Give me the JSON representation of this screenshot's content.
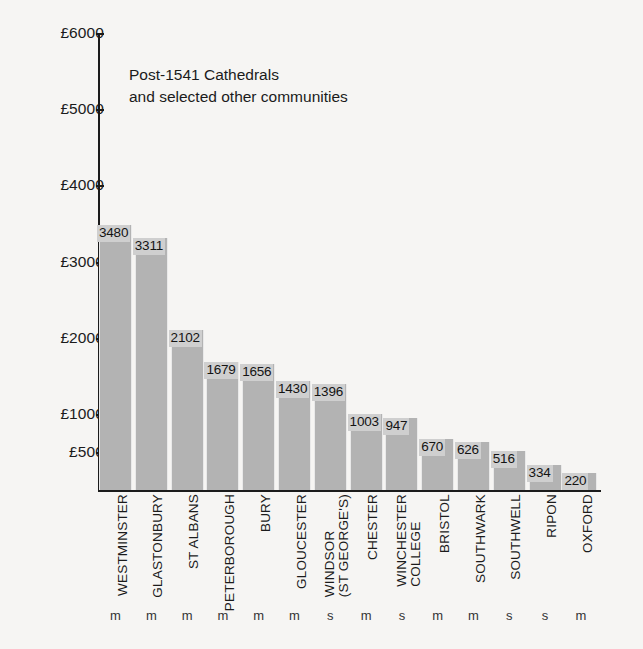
{
  "chart_data": {
    "type": "bar",
    "title": "Post-1541 Cathedrals and selected other communities",
    "title_lines": [
      "Post-1541 Cathedrals",
      "and selected other communities"
    ],
    "xlabel": "",
    "ylabel": "",
    "ylim": [
      0,
      6000
    ],
    "grid": false,
    "legend": null,
    "currency_symbol": "£",
    "y_ticks": [
      {
        "value": 6000,
        "label": "£6000"
      },
      {
        "value": 5000,
        "label": "£5000"
      },
      {
        "value": 4000,
        "label": "£4000"
      },
      {
        "value": 3000,
        "label": "£3000"
      },
      {
        "value": 2000,
        "label": "£2000"
      },
      {
        "value": 1000,
        "label": "£1000"
      },
      {
        "value": 500,
        "label": "£500"
      }
    ],
    "categories": [
      "WESTMINSTER",
      "GLASTONBURY",
      "ST ALBANS",
      "PETERBOROUGH",
      "BURY",
      "GLOUCESTER",
      "WINDSOR (ST GEORGE'S)",
      "CHESTER",
      "WINCHESTER COLLEGE",
      "BRISTOL",
      "SOUTHWARK",
      "SOUTHWELL",
      "RIPON",
      "OXFORD"
    ],
    "category_label_lines": [
      [
        "WESTMINSTER"
      ],
      [
        "GLASTONBURY"
      ],
      [
        "ST ALBANS"
      ],
      [
        "PETERBOROUGH"
      ],
      [
        "BURY"
      ],
      [
        "GLOUCESTER"
      ],
      [
        "WINDSOR",
        "(ST GEORGE'S)"
      ],
      [
        "CHESTER"
      ],
      [
        "WINCHESTER",
        "COLLEGE"
      ],
      [
        "BRISTOL"
      ],
      [
        "SOUTHWARK"
      ],
      [
        "SOUTHWELL"
      ],
      [
        "RIPON"
      ],
      [
        "OXFORD"
      ]
    ],
    "values": [
      3480,
      3311,
      2102,
      1679,
      1656,
      1430,
      1396,
      1003,
      947,
      670,
      626,
      516,
      334,
      220
    ],
    "value_labels": [
      "3480",
      "3311",
      "2102",
      "1679",
      "1656",
      "1430",
      "1396",
      "1003",
      "947",
      "670",
      "626",
      "516",
      "334",
      "220"
    ],
    "markers": [
      "m",
      "m",
      "m",
      "m",
      "m",
      "m",
      "s",
      "m",
      "s",
      "m",
      "m",
      "s",
      "s",
      "m"
    ],
    "colors": {
      "bar_fill": "#b3b3b3",
      "value_label_bg": "#cfcfcf",
      "axis": "#1b1b1b",
      "background": "#f6f5f3",
      "text": "#1b1b1b"
    }
  }
}
